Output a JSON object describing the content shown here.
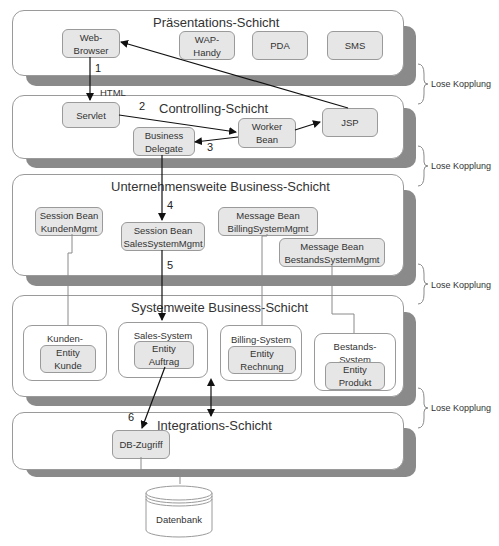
{
  "layers": [
    {
      "title": "Präsentations-Schicht"
    },
    {
      "title": "Controlling-Schicht"
    },
    {
      "title": "Unternehmensweite Business-Schicht"
    },
    {
      "title": "Systemweite Business-Schicht"
    },
    {
      "title": "Integrations-Schicht"
    }
  ],
  "presentation": {
    "web_browser": "Web-\nBrowser",
    "wap_handy": "WAP-\nHandy",
    "pda": "PDA",
    "sms": "SMS"
  },
  "controlling": {
    "servlet": "Servlet",
    "business_delegate": "Business\nDelegate",
    "worker_bean": "Worker\nBean",
    "jsp": "JSP"
  },
  "enterprise": {
    "session_kunden": "Session Bean\nKundenMgmt",
    "session_sales": "Session Bean\nSalesSystemMgmt",
    "message_billing": "Message Bean\nBillingSystemMgmt",
    "message_bestands": "Message Bean\nBestandsSystemMgmt"
  },
  "systemwide": {
    "groups": [
      {
        "label": "Kunden-Verwaltung",
        "entity": "Entity\nKunde"
      },
      {
        "label": "Sales-System",
        "entity": "Entity\nAuftrag"
      },
      {
        "label": "Billing-System",
        "entity": "Entity\nRechnung"
      },
      {
        "label": "Bestands-\nSystem",
        "entity": "Entity\nProdukt"
      }
    ]
  },
  "integration": {
    "db_access": "DB-Zugriff"
  },
  "database": {
    "label": "Datenbank"
  },
  "edge_labels": {
    "html": "HTML",
    "steps": [
      "1",
      "2",
      "3",
      "4",
      "5",
      "6"
    ]
  },
  "coupling_label": "Lose Kopplung"
}
